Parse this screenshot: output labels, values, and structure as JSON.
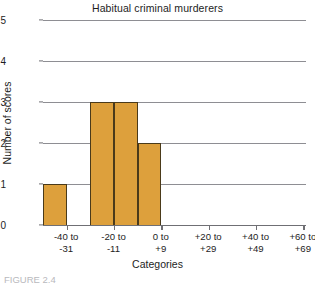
{
  "chart_data": {
    "type": "bar",
    "title": "Habitual criminal murderers",
    "xlabel": "Categories",
    "ylabel": "Number of scores",
    "categories": [
      "-40 to\n-31",
      "-20 to\n-11",
      "0 to\n+9",
      "+20 to\n+29",
      "+40 to\n+49",
      "+60 to\n+69"
    ],
    "bin_width": 10,
    "bars": [
      {
        "label": "-40 to -31",
        "value": 1,
        "left_pct": 0.0,
        "width_pct": 9.0
      },
      {
        "label": "-30 to -21",
        "value": 0,
        "left_pct": 9.0,
        "width_pct": 9.0
      },
      {
        "label": "-20 to -11",
        "value": 3,
        "left_pct": 18.0,
        "width_pct": 9.0
      },
      {
        "label": "-10 to -1",
        "value": 3,
        "left_pct": 27.0,
        "width_pct": 9.0
      },
      {
        "label": "0 to +9",
        "value": 2,
        "left_pct": 36.0,
        "width_pct": 9.0
      },
      {
        "label": "+10 to +19",
        "value": 0,
        "left_pct": 45.0,
        "width_pct": 9.0
      },
      {
        "label": "+20 to +29",
        "value": 0,
        "left_pct": 54.0,
        "width_pct": 9.0
      },
      {
        "label": "+30 to +39",
        "value": 0,
        "left_pct": 63.0,
        "width_pct": 9.0
      },
      {
        "label": "+40 to +49",
        "value": 0,
        "left_pct": 72.0,
        "width_pct": 9.0
      },
      {
        "label": "+50 to +59",
        "value": 0,
        "left_pct": 81.0,
        "width_pct": 9.0
      },
      {
        "label": "+60 to +69",
        "value": 0,
        "left_pct": 90.0,
        "width_pct": 9.0
      }
    ],
    "yticks": [
      0,
      1,
      2,
      3,
      4,
      5
    ],
    "ylim": [
      0,
      5
    ],
    "grid": true,
    "legend": null,
    "bar_color": "#dda03c",
    "bar_edge_color": "#4a3a1a",
    "grid_color": "#8e8e93",
    "axis_color": "#6f6f74"
  },
  "caption": {
    "text": "FIGURE 2.4"
  }
}
